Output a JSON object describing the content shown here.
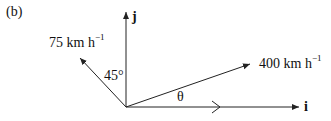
{
  "figure": {
    "panel_label": "(b)",
    "axes": {
      "x_label": "i",
      "y_label": "j"
    },
    "vectors": [
      {
        "name": "wind-velocity",
        "magnitude": "75",
        "unit": "km h",
        "unit_exponent": "−1",
        "angle_label": "45°"
      },
      {
        "name": "plane-velocity",
        "magnitude": "400",
        "unit": "km h",
        "unit_exponent": "−1",
        "angle_label": "θ"
      }
    ],
    "colors": {
      "line": "#222222",
      "text": "#111111",
      "background": "#ffffff"
    }
  }
}
